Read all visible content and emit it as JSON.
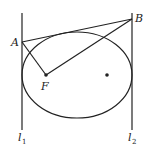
{
  "diagram": {
    "type": "geometry",
    "colors": {
      "stroke": "#222222",
      "background": "#ffffff"
    },
    "points": {
      "A": {
        "label": "A",
        "x": 22,
        "y": 42
      },
      "B": {
        "label": "B",
        "x": 132,
        "y": 19
      },
      "F": {
        "label": "F",
        "x": 46,
        "y": 75
      },
      "center": {
        "label": "",
        "x": 107,
        "y": 75
      }
    },
    "ellipse": {
      "cx": 77,
      "cy": 75,
      "rx": 55,
      "ry": 43
    },
    "lines": {
      "l1": {
        "label": "l",
        "subscript": "1",
        "x": 22,
        "y1": 13,
        "y2": 130
      },
      "l2": {
        "label": "l",
        "subscript": "2",
        "x": 132,
        "y1": 13,
        "y2": 130
      }
    },
    "segments": [
      "AB",
      "AF",
      "BF"
    ]
  }
}
